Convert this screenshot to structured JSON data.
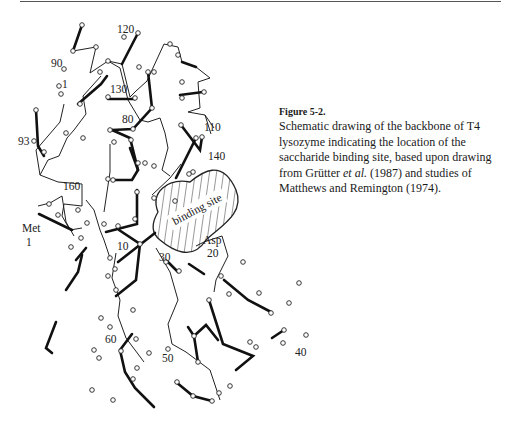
{
  "figure": {
    "label": "Figure 5-2.",
    "caption_parts": {
      "before_italic": "Schematic drawing of the backbone of T4 lysozyme indicating the location of the saccharide binding site, based upon drawing from Grütter ",
      "italic": "et al.",
      "after_italic": " (1987) and studies of Matthews and Remington (1974)."
    },
    "region_label": "binding site",
    "residue_labels": [
      {
        "text": "120",
        "x": 117,
        "y": 33
      },
      {
        "text": "90",
        "x": 51,
        "y": 67
      },
      {
        "text": "1",
        "x": 62,
        "y": 88
      },
      {
        "text": "130",
        "x": 110,
        "y": 93
      },
      {
        "text": "80",
        "x": 122,
        "y": 123
      },
      {
        "text": "110",
        "x": 204,
        "y": 131
      },
      {
        "text": "93",
        "x": 18,
        "y": 145
      },
      {
        "text": "140",
        "x": 208,
        "y": 160
      },
      {
        "text": "160",
        "x": 63,
        "y": 190
      },
      {
        "text": "Met",
        "x": 22,
        "y": 232
      },
      {
        "text": "1",
        "x": 26,
        "y": 246
      },
      {
        "text": "10",
        "x": 117,
        "y": 250
      },
      {
        "text": "Asp",
        "x": 203,
        "y": 244
      },
      {
        "text": "20",
        "x": 207,
        "y": 257
      },
      {
        "text": "30",
        "x": 159,
        "y": 261
      },
      {
        "text": "60",
        "x": 105,
        "y": 343
      },
      {
        "text": "50",
        "x": 162,
        "y": 362
      },
      {
        "text": "40",
        "x": 295,
        "y": 356
      }
    ]
  }
}
